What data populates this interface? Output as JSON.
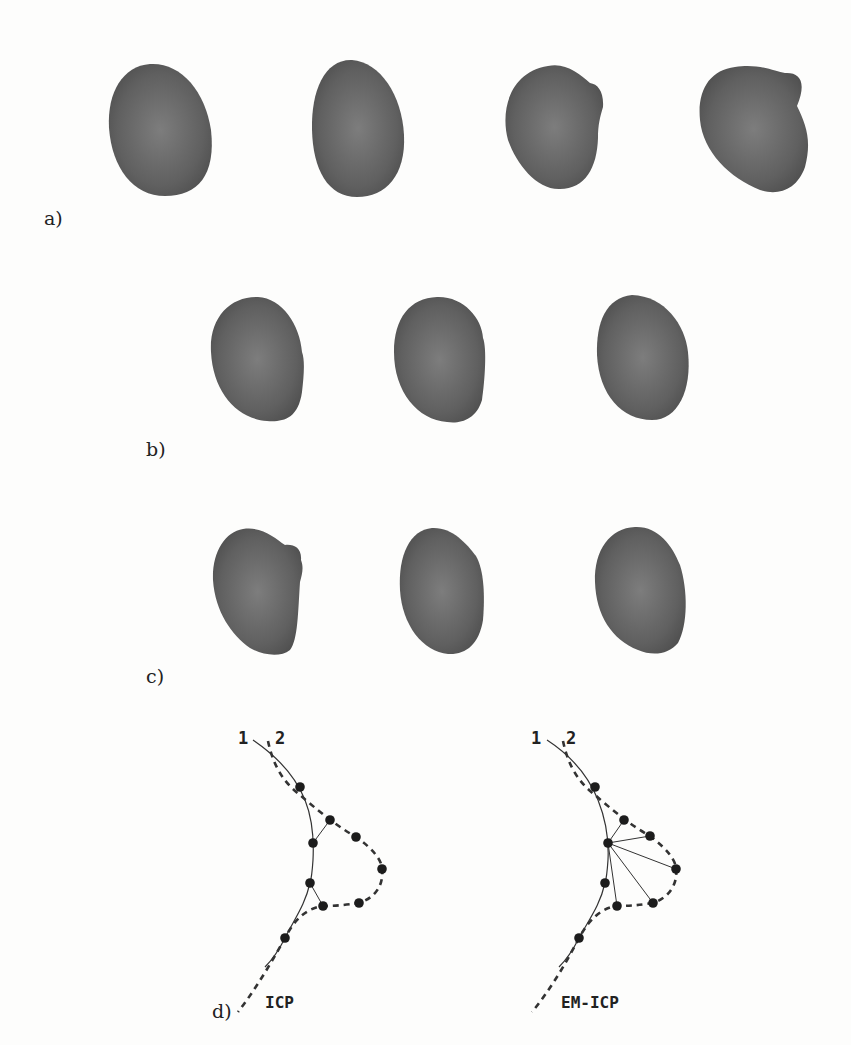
{
  "figure": {
    "panels": [
      {
        "id": "a",
        "label": "a)",
        "shape_count": 4
      },
      {
        "id": "b",
        "label": "b)",
        "shape_count": 3
      },
      {
        "id": "c",
        "label": "c)",
        "shape_count": 3
      },
      {
        "id": "d",
        "label": "d)"
      }
    ],
    "diagram_d": {
      "left": {
        "title": "ICP",
        "curve_labels": [
          "1",
          "2"
        ]
      },
      "right": {
        "title": "EM-ICP",
        "curve_labels": [
          "1",
          "2"
        ]
      }
    },
    "colors": {
      "shape_fill": "#5a5a5a",
      "shape_highlight": "#7a7a7a",
      "line": "#333333",
      "dot": "#1c1c1c",
      "background": "#fdfdfc"
    }
  }
}
